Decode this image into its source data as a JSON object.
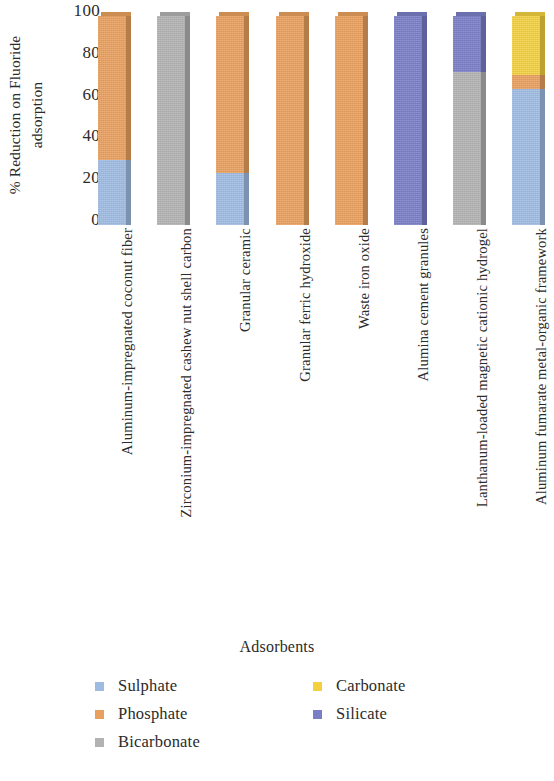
{
  "chart_data": {
    "type": "bar",
    "subtype": "stacked-column-100",
    "title": "",
    "xlabel": "Adsorbents",
    "ylabel": "% Reduction on Fluoride adsorption",
    "ylabel_line1": "% Reduction on Fluoride",
    "ylabel_line2": "adsorption",
    "ylim": [
      0,
      100
    ],
    "yticks": [
      0,
      20,
      40,
      60,
      80,
      100
    ],
    "ytick_labels": [
      "0",
      "20",
      "40",
      "60",
      "80",
      "100"
    ],
    "grid": false,
    "legend_position": "bottom",
    "categories": [
      "Aluminum-impregnated coconut fiber",
      "Zirconium-impregnated cashew nut shell carbon",
      "Granular ceramic",
      "Granular ferric hydroxide",
      "Waste iron oxide",
      "Alumina cement granules",
      "Lanthanum-loaded magnetic cationic hydrogel",
      "Aluminum fumarate metal-organic framework"
    ],
    "series": [
      {
        "name": "Sulphate",
        "color": "#9FBBE2",
        "values": [
          31,
          0,
          25,
          0,
          0,
          0,
          0,
          65
        ]
      },
      {
        "name": "Phosphate",
        "color": "#E8A05E",
        "values": [
          69,
          0,
          75,
          100,
          100,
          0,
          0,
          7
        ]
      },
      {
        "name": "Bicarbonate",
        "color": "#B2B2B2",
        "values": [
          0,
          100,
          0,
          0,
          0,
          0,
          73,
          0
        ]
      },
      {
        "name": "Carbonate",
        "color": "#F2D040",
        "values": [
          0,
          0,
          0,
          0,
          0,
          0,
          0,
          28
        ]
      },
      {
        "name": "Silicate",
        "color": "#7A7EC6",
        "values": [
          0,
          0,
          0,
          0,
          0,
          100,
          27,
          0
        ]
      }
    ],
    "legend_columns": [
      [
        "Sulphate",
        "Phosphate",
        "Bicarbonate"
      ],
      [
        "Carbonate",
        "Silicate"
      ]
    ]
  }
}
